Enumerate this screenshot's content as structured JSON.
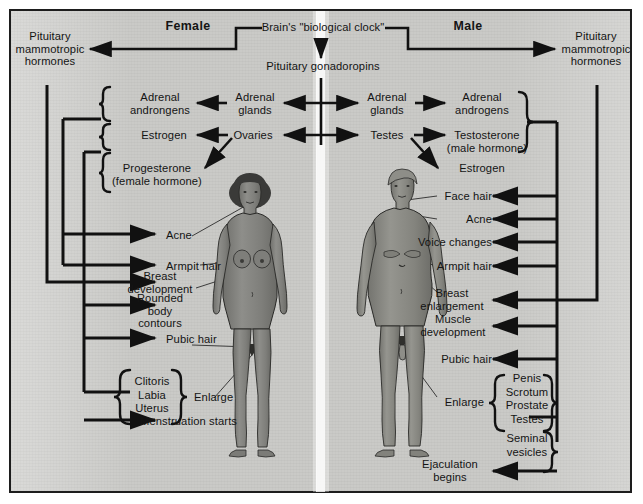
{
  "diagram": {
    "title_female": "Female",
    "title_male": "Male",
    "central": {
      "clock": "Brain's \"biological clock\"",
      "gonadotropins": "Pituitary gonadoropins"
    },
    "pituitary_left": "Pituitary\nmammotropic\nhormones",
    "pituitary_right": "Pituitary\nmammotropic\nhormones",
    "female_glands": {
      "adrenal_glands": "Adrenal\nglands",
      "ovaries": "Ovaries"
    },
    "male_glands": {
      "adrenal_glands": "Adrenal\nglands",
      "testes": "Testes"
    },
    "female_hormones": [
      "Adrenal\nandrongens",
      "Estrogen",
      "Progesterone\n(female hormone)"
    ],
    "male_hormones": [
      "Adrenal\nandrogens",
      "Testosterone\n(male hormone)",
      "Estrogen"
    ],
    "female_effects": [
      "Acne",
      "Armpit hair",
      "Breast\ndevelopment",
      "Rounded\nbody\ncontours",
      "Pubic hair",
      "Menstruation starts"
    ],
    "female_enlarge_group": "Clitoris\nLabia\nUterus",
    "female_enlarge_label": "Enlarge",
    "male_effects": [
      "Face hair",
      "Acne",
      "Voice changes",
      "Armpit hair",
      "Breast\nenlargement",
      "Muscle\ndevelopment",
      "Pubic hair",
      "Ejaculation\nbegins"
    ],
    "male_enlarge_group": "Penis\nScrotum\nProstate\nTestes",
    "male_enlarge_group2": "Seminal\nvesicles",
    "male_enlarge_label": "Enlarge",
    "colors": {
      "background": "#c9c9c6",
      "border": "#1d1d1d",
      "ink": "#141414",
      "figure_skin": "#8a8a86",
      "figure_outline": "#2a2a28",
      "page": "#ffffff"
    }
  }
}
